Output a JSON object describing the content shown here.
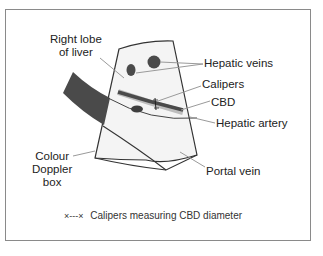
{
  "labels": {
    "right_lobe": [
      "Right lobe",
      "of liver"
    ],
    "hepatic_veins": "Hepatic veins",
    "calipers": "Calipers",
    "cbd": "CBD",
    "hepatic_artery": "Hepatic artery",
    "colour_doppler": [
      "Colour",
      "Doppler",
      "box"
    ],
    "portal_vein": "Portal vein"
  },
  "legend": {
    "symbol": "×---×",
    "text": "Calipers measuring CBD diameter"
  },
  "colors": {
    "outline": "#333333",
    "structure_fill": "#4a4a4a",
    "sector_fill": "#f4f4f4",
    "leader": "#9a9a9a",
    "frame": "#8a8a8a"
  }
}
